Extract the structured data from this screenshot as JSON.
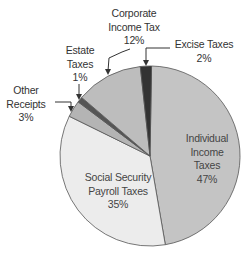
{
  "chart_data": {
    "type": "pie",
    "title": "",
    "categories": [
      "Individual Income Taxes",
      "Social Security Payroll Taxes",
      "Other Receipts",
      "Estate Taxes",
      "Corporate Income Tax",
      "Excise Taxes"
    ],
    "values": [
      47,
      35,
      3,
      1,
      12,
      2
    ],
    "unit": "%",
    "colors": [
      "#c4c4c4",
      "#ececec",
      "#b4b4b4",
      "#555555",
      "#bdbdbd",
      "#333333"
    ],
    "legend": "none (direct labels)"
  },
  "labels": {
    "individual": {
      "line1": "Individual",
      "line2": "Income",
      "line3": "Taxes",
      "pct": "47%"
    },
    "social": {
      "line1": "Social Security",
      "line2": "Payroll Taxes",
      "pct": "35%"
    },
    "other": {
      "line1": "Other",
      "line2": "Receipts",
      "pct": "3%"
    },
    "estate": {
      "line1": "Estate",
      "line2": "Taxes",
      "pct": "1%"
    },
    "corporate": {
      "line1": "Corporate",
      "line2": "Income Tax",
      "pct": "12%"
    },
    "excise": {
      "line1": "Excise Taxes",
      "pct": "2%"
    }
  }
}
